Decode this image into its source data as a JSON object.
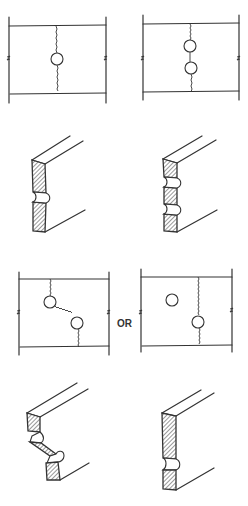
{
  "figure": {
    "connector_label": "OR",
    "panels": [
      {
        "id": "single-hole-plan",
        "holes": 1,
        "failure_path": "straight transverse through one hole"
      },
      {
        "id": "two-holes-inline-plan",
        "holes": 2,
        "failure_path": "straight transverse through two holes in line"
      },
      {
        "id": "single-hole-fracture",
        "view": "isometric",
        "notches": 1
      },
      {
        "id": "two-holes-fracture",
        "view": "isometric",
        "notches": 2
      },
      {
        "id": "staggered-zigzag-plan",
        "holes": 2,
        "failure_path": "zigzag through staggered holes"
      },
      {
        "id": "staggered-straight-plan",
        "holes": 2,
        "failure_path": "straight through one of two staggered holes"
      },
      {
        "id": "zigzag-fracture",
        "view": "isometric",
        "notches": 2
      },
      {
        "id": "straight-fracture",
        "view": "isometric",
        "notches": 1
      }
    ],
    "colors": {
      "line": "#333333",
      "background": "#ffffff"
    }
  }
}
